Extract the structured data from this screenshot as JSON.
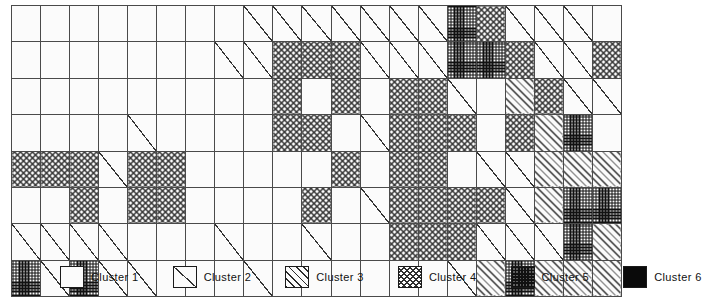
{
  "legend": {
    "items": [
      {
        "label": "Cluster 1",
        "cluster": 1,
        "pattern": "blank-white",
        "color": "#fbfbfb"
      },
      {
        "label": "Cluster 2",
        "cluster": 2,
        "pattern": "single-diagonal-line",
        "color": "#333333"
      },
      {
        "label": "Cluster 3",
        "cluster": 3,
        "pattern": "diagonal-hatch",
        "color": "#2b2b2b"
      },
      {
        "label": "Cluster 4",
        "cluster": 4,
        "pattern": "cross-hatch-open",
        "color": "#2f2f2f"
      },
      {
        "label": "Cluster 5",
        "cluster": 5,
        "pattern": "dense-stipple-dark",
        "color": "#5d5d5d"
      },
      {
        "label": "Cluster 6",
        "cluster": 6,
        "pattern": "solid-black",
        "color": "#0a0a0a"
      }
    ]
  },
  "chart_data": {
    "type": "heatmap",
    "title": "",
    "subtitle": "",
    "xlabel": "",
    "ylabel": "",
    "grid": true,
    "legend_position": "bottom",
    "rows": 7,
    "cols": 21,
    "value_labels": [
      "Cluster 1",
      "Cluster 2",
      "Cluster 3",
      "Cluster 4",
      "Cluster 5",
      "Cluster 6"
    ],
    "values": [
      [
        6,
        6,
        6,
        6,
        1,
        1,
        1,
        1,
        2,
        2,
        2,
        2,
        2,
        2,
        2,
        5,
        4,
        2,
        2,
        2,
        1
      ],
      [
        6,
        1,
        6,
        6,
        6,
        1,
        1,
        2,
        2,
        4,
        4,
        4,
        2,
        2,
        2,
        5,
        5,
        4,
        2,
        2,
        4
      ],
      [
        1,
        6,
        1,
        6,
        1,
        1,
        1,
        1,
        1,
        4,
        1,
        4,
        1,
        4,
        4,
        2,
        1,
        3,
        4,
        2,
        2
      ],
      [
        1,
        1,
        1,
        1,
        2,
        1,
        1,
        1,
        1,
        4,
        4,
        1,
        2,
        4,
        4,
        4,
        1,
        4,
        3,
        5,
        1
      ],
      [
        4,
        4,
        4,
        2,
        4,
        4,
        1,
        1,
        1,
        1,
        1,
        4,
        1,
        4,
        4,
        1,
        2,
        2,
        3,
        3,
        3
      ],
      [
        1,
        1,
        4,
        1,
        4,
        4,
        1,
        1,
        1,
        1,
        4,
        1,
        2,
        4,
        4,
        4,
        4,
        2,
        3,
        5,
        5
      ],
      [
        2,
        2,
        2,
        2,
        1,
        1,
        1,
        2,
        1,
        1,
        2,
        1,
        1,
        4,
        4,
        4,
        2,
        2,
        2,
        5,
        3
      ],
      [
        5,
        2,
        5,
        2,
        2,
        1,
        1,
        1,
        2,
        1,
        1,
        1,
        1,
        1,
        1,
        2,
        3,
        5,
        3,
        3,
        3
      ]
    ]
  }
}
